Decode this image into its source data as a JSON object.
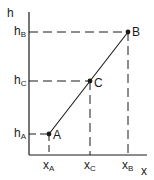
{
  "diagram": {
    "axes": {
      "y_label": "h",
      "x_label": "x",
      "origin": [
        29,
        155
      ],
      "y_top": 12,
      "x_right": 147,
      "color": "#1a1a1a"
    },
    "points": [
      {
        "id": "A",
        "label": "A",
        "x": 49,
        "y": 134,
        "h_label_main": "h",
        "h_label_sub": "A",
        "x_label_main": "x",
        "x_label_sub": "A"
      },
      {
        "id": "C",
        "label": "C",
        "x": 90,
        "y": 81,
        "h_label_main": "h",
        "h_label_sub": "C",
        "x_label_main": "x",
        "x_label_sub": "C"
      },
      {
        "id": "B",
        "label": "B",
        "x": 128,
        "y": 32,
        "h_label_main": "h",
        "h_label_sub": "B",
        "x_label_main": "x",
        "x_label_sub": "B"
      }
    ],
    "line": {
      "from": "A",
      "to": "B"
    },
    "dashed_guides": true
  }
}
